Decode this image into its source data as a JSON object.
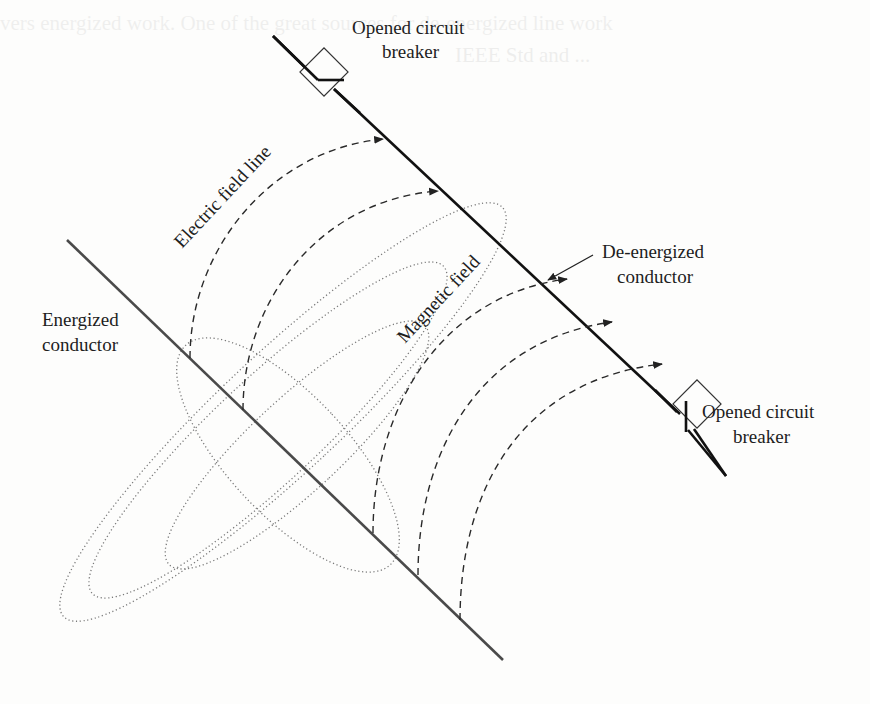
{
  "figure": {
    "labels": {
      "breaker_top_line1": "Opened circuit",
      "breaker_top_line2": "breaker",
      "breaker_bottom_line1": "Opened circuit",
      "breaker_bottom_line2": "breaker",
      "electric_field_line": "Electric field line",
      "magnetic_field": "Magnetic field",
      "deenergized_line1": "De-energized",
      "deenergized_line2": "conductor",
      "energized_line1": "Energized",
      "energized_line2": "conductor"
    },
    "colors": {
      "deenergized_conductor": "#111111",
      "energized_conductor": "#4a4a4a",
      "electric_field": "#333333",
      "magnetic_field": "#777777",
      "background": "#fdfdfc"
    }
  },
  "ghost_text": {
    "top_line1": "vers energized work. One of the great sources for de-energized line work",
    "top_line2": "IEEE Std and ..."
  }
}
